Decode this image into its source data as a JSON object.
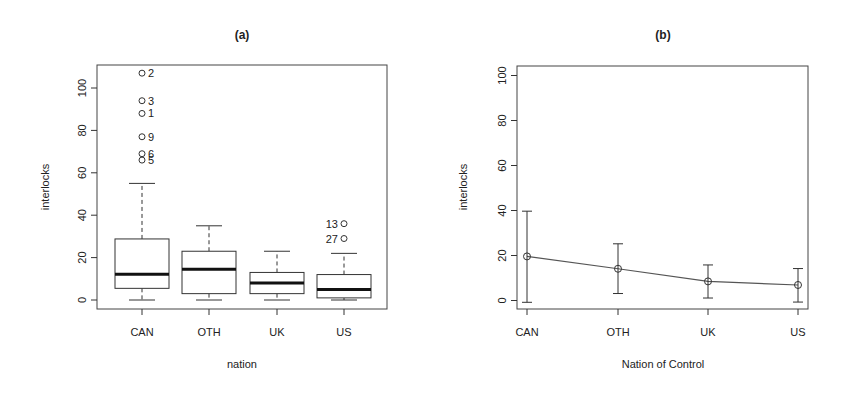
{
  "figure": {
    "panel_a_title": "(a)",
    "panel_b_title": "(b)"
  },
  "chart_data": [
    {
      "type": "box",
      "title": "(a)",
      "xlabel": "nation",
      "ylabel": "interlocks",
      "categories": [
        "CAN",
        "OTH",
        "UK",
        "US"
      ],
      "yticks": [
        0,
        20,
        40,
        60,
        80,
        100
      ],
      "ylim": [
        -3,
        110
      ],
      "grid": false,
      "boxes": [
        {
          "category": "CAN",
          "whisker_low": 0,
          "q1": 5.5,
          "median": 12.2,
          "q3": 28.8,
          "whisker_high": 55
        },
        {
          "category": "OTH",
          "whisker_low": 0,
          "q1": 3,
          "median": 14.5,
          "q3": 23,
          "whisker_high": 35
        },
        {
          "category": "UK",
          "whisker_low": 0,
          "q1": 3,
          "median": 8,
          "q3": 13,
          "whisker_high": 23
        },
        {
          "category": "US",
          "whisker_low": 0,
          "q1": 1,
          "median": 5,
          "q3": 12,
          "whisker_high": 22
        }
      ],
      "outliers": [
        {
          "category": "CAN",
          "value": 107,
          "label": "2",
          "label_side": "right"
        },
        {
          "category": "CAN",
          "value": 94,
          "label": "3",
          "label_side": "right"
        },
        {
          "category": "CAN",
          "value": 88,
          "label": "1",
          "label_side": "right"
        },
        {
          "category": "CAN",
          "value": 77,
          "label": "9",
          "label_side": "right"
        },
        {
          "category": "CAN",
          "value": 69,
          "label": "6",
          "label_side": "right"
        },
        {
          "category": "CAN",
          "value": 66,
          "label": "5",
          "label_side": "right"
        },
        {
          "category": "US",
          "value": 36,
          "label": "13",
          "label_side": "left"
        },
        {
          "category": "US",
          "value": 29,
          "label": "27",
          "label_side": "left"
        }
      ]
    },
    {
      "type": "line",
      "title": "(b)",
      "xlabel": "Nation of Control",
      "ylabel": "interlocks",
      "categories": [
        "CAN",
        "OTH",
        "UK",
        "US"
      ],
      "yticks": [
        0,
        20,
        40,
        60,
        80,
        100
      ],
      "ylim": [
        -4,
        104
      ],
      "grid": false,
      "series": [
        {
          "name": "mean interlocks",
          "values": [
            19.6,
            14.1,
            8.5,
            6.9
          ],
          "error_low": [
            -0.8,
            3.1,
            1.1,
            -0.7
          ],
          "error_high": [
            39.7,
            25.2,
            15.8,
            14.2
          ]
        }
      ]
    }
  ]
}
